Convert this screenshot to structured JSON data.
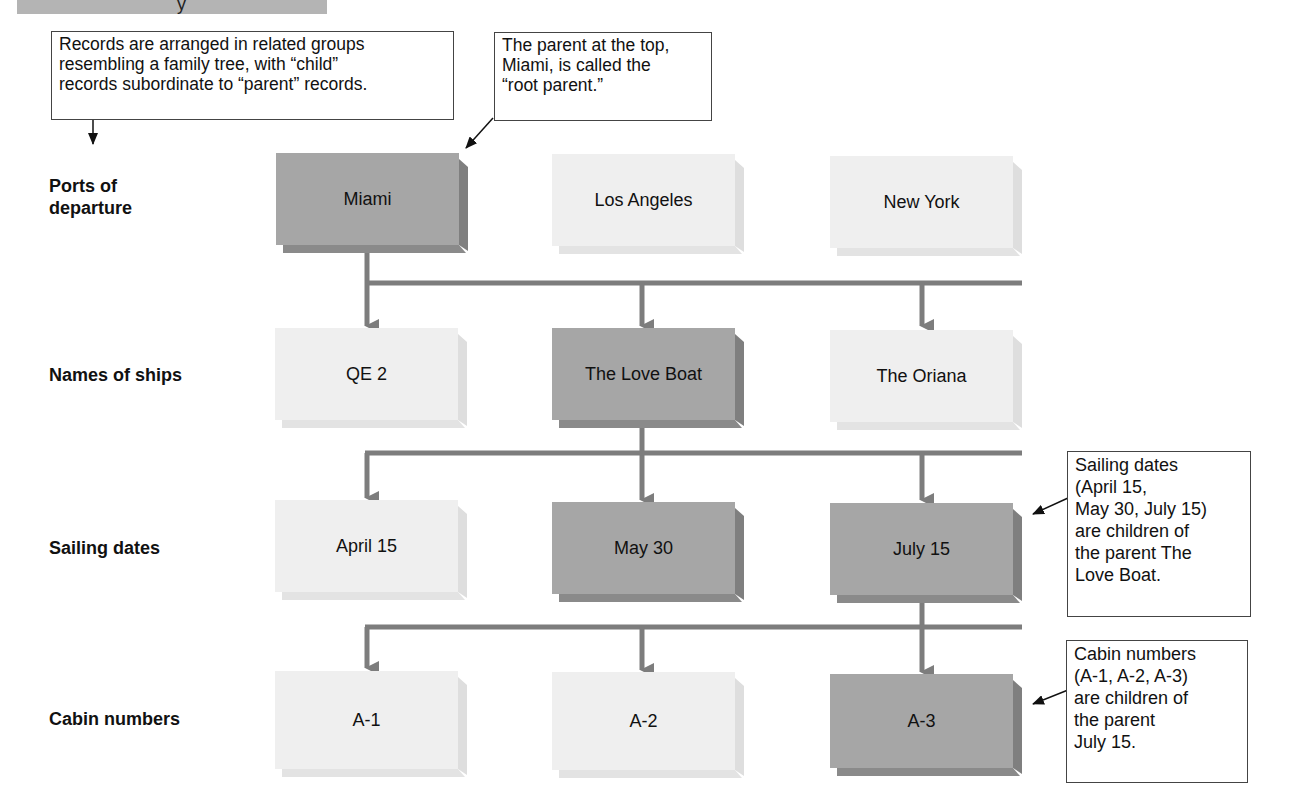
{
  "header": {
    "cut_off_glyph": "y"
  },
  "callouts": {
    "arrangement": [
      "Records are arranged in related groups",
      "resembling a family tree, with “child”",
      "records subordinate to “parent” records."
    ],
    "root_parent": [
      "The parent at the top,",
      "Miami, is called the",
      "“root parent.”"
    ],
    "sailing_dates": [
      "Sailing dates",
      "(April 15,",
      "May 30, July 15)",
      "are children of",
      "the parent The",
      "Love Boat."
    ],
    "cabin_numbers": [
      "Cabin numbers",
      "(A-1, A-2, A-3)",
      "are children of",
      "the parent",
      "July 15."
    ]
  },
  "levels": [
    {
      "label": [
        "Ports of",
        "departure"
      ],
      "nodes": [
        {
          "text": "Miami",
          "highlighted": true
        },
        {
          "text": "Los Angeles",
          "highlighted": false
        },
        {
          "text": "New York",
          "highlighted": false
        }
      ]
    },
    {
      "label": [
        "Names of ships"
      ],
      "nodes": [
        {
          "text": "QE 2",
          "highlighted": false
        },
        {
          "text": "The Love Boat",
          "highlighted": true
        },
        {
          "text": "The Oriana",
          "highlighted": false
        }
      ]
    },
    {
      "label": [
        "Sailing dates"
      ],
      "nodes": [
        {
          "text": "April 15",
          "highlighted": false
        },
        {
          "text": "May 30",
          "highlighted": true
        },
        {
          "text": "July 15",
          "highlighted": true
        }
      ]
    },
    {
      "label": [
        "Cabin numbers"
      ],
      "nodes": [
        {
          "text": "A-1",
          "highlighted": false
        },
        {
          "text": "A-2",
          "highlighted": false
        },
        {
          "text": "A-3",
          "highlighted": true
        }
      ]
    }
  ],
  "colors": {
    "highlighted_box": "#a6a6a6",
    "plain_box": "#efefef",
    "connector": "#7d7d7d",
    "callout_border": "#444444"
  }
}
